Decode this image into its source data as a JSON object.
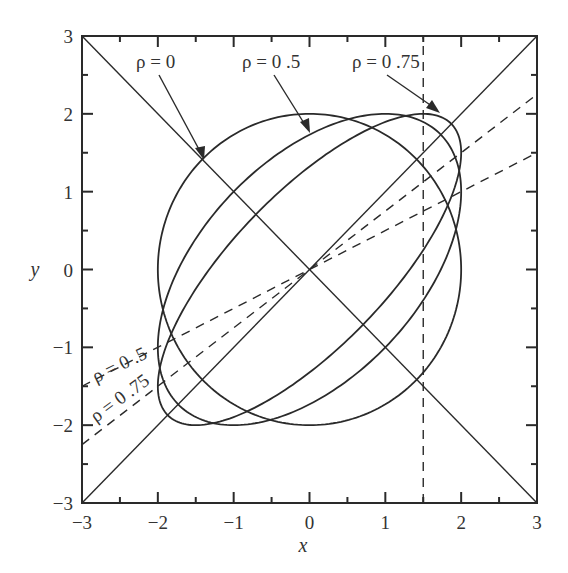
{
  "chart_data": {
    "type": "line",
    "title": "",
    "xlabel": "x",
    "ylabel": "y",
    "xlim": [
      -3,
      3
    ],
    "ylim": [
      -3,
      3
    ],
    "grid": false,
    "legend": "none (inline annotations with arrows)",
    "x_ticks": [
      -3,
      -2,
      -1,
      0,
      1,
      2,
      3
    ],
    "y_ticks": [
      -3,
      -2,
      -1,
      0,
      1,
      2,
      3
    ],
    "x_tick_labels": [
      "−3",
      "−2",
      "−1",
      "0",
      "1",
      "2",
      "3"
    ],
    "y_tick_labels": [
      "−3",
      "−2",
      "−1",
      "0",
      "1",
      "2",
      "3"
    ],
    "minor_ticks_step": 0.5,
    "series": [
      {
        "name": "ρ = 0",
        "kind": "ellipse",
        "rho": 0,
        "equation": "x^2 - 2*rho*x*y + y^2 = 4*(1 - rho^2)",
        "extent": {
          "x": [
            -2,
            2
          ],
          "y": [
            -2,
            2
          ]
        },
        "style": "solid"
      },
      {
        "name": "ρ = 0.5",
        "kind": "ellipse",
        "rho": 0.5,
        "equation": "x^2 - 2*rho*x*y + y^2 = 4*(1 - rho^2)",
        "extent": {
          "x": [
            -2,
            2
          ],
          "y": [
            -2,
            2
          ]
        },
        "style": "solid"
      },
      {
        "name": "ρ = 0.75",
        "kind": "ellipse",
        "rho": 0.75,
        "equation": "x^2 - 2*rho*x*y + y^2 = 4*(1 - rho^2)",
        "extent": {
          "x": [
            -2,
            2
          ],
          "y": [
            -2,
            2
          ]
        },
        "style": "solid"
      },
      {
        "name": "y = x",
        "kind": "line",
        "points": [
          [
            -3,
            -3
          ],
          [
            3,
            3
          ]
        ],
        "style": "solid"
      },
      {
        "name": "y = -x",
        "kind": "line",
        "points": [
          [
            -3,
            3
          ],
          [
            3,
            -3
          ]
        ],
        "style": "solid"
      },
      {
        "name": "ρ = 0.5 regression line",
        "kind": "line",
        "points": [
          [
            -3,
            -1.5
          ],
          [
            3,
            1.5
          ]
        ],
        "style": "dashed"
      },
      {
        "name": "ρ = 0.75 regression line",
        "kind": "line",
        "points": [
          [
            -3,
            -2.25
          ],
          [
            3,
            2.25
          ]
        ],
        "style": "dashed"
      },
      {
        "name": "x = 1.5",
        "kind": "line",
        "points": [
          [
            1.5,
            -3
          ],
          [
            1.5,
            3
          ]
        ],
        "style": "dashed"
      }
    ],
    "annotations": [
      {
        "text": "ρ = 0",
        "label_xy": [
          -1.5,
          2.52
        ],
        "arrow_to": [
          -1.47,
          1.42
        ]
      },
      {
        "text": "ρ = 0.5",
        "label_xy": [
          -0.4,
          2.52
        ],
        "arrow_to": [
          -0.04,
          1.83
        ]
      },
      {
        "text": "ρ = 0.75",
        "label_xy": [
          0.78,
          2.52
        ],
        "arrow_to": [
          1.72,
          1.98
        ]
      },
      {
        "text": "ρ = 0.5",
        "label_xy": [
          -2.7,
          -1.45
        ],
        "rotation_deg": -26,
        "along": "dashed line slope 0.5"
      },
      {
        "text": "ρ = 0.75",
        "label_xy": [
          -2.7,
          -2.1
        ],
        "rotation_deg": -36,
        "along": "dashed line slope 0.75"
      }
    ]
  },
  "axes": {
    "x_label": "x",
    "y_label": "y"
  },
  "labels": {
    "rho0": "ρ = 0",
    "rho05": "ρ = 0 .5",
    "rho075": "ρ = 0 .75",
    "rho05_line": "ρ = 0 .5",
    "rho075_line": "ρ = 0 .75"
  },
  "colors": {
    "ink": "#2a2a2a",
    "background": "#ffffff"
  }
}
